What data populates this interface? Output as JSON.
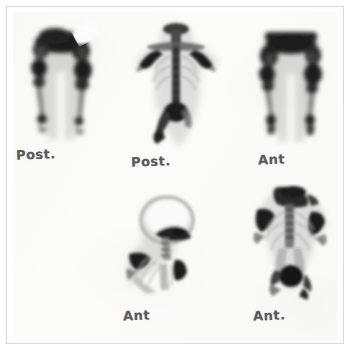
{
  "film": {
    "media_type": "nuclear-medicine-bone-scintigraphy-film",
    "background_color": "#fbfbfa",
    "border_color": "#d9d9d9",
    "uptake_color": "#1d1d1d",
    "soft_tissue_color": "#9a9a9a"
  },
  "panels": [
    {
      "id": "panel-top-left",
      "label": "Post.",
      "view": "posterior",
      "region": "lower-extremities",
      "description": "Posterior view of pelvis, femurs, knees, tibias and ankles with intense uptake at pelvis, knees and ankles"
    },
    {
      "id": "panel-top-center",
      "label": "Post.",
      "view": "posterior",
      "region": "torso-spine",
      "description": "Posterior whole-body torso showing skull base, shoulders, humeri, vertebral column, ribs and pelvis with bladder activity"
    },
    {
      "id": "panel-top-right",
      "label": "Ant",
      "view": "anterior",
      "region": "lower-extremities",
      "description": "Anterior view of pelvis, femurs, knees, tibias and ankles with intense uptake at pelvis, knees and ankles"
    },
    {
      "id": "panel-bottom-center",
      "label": "Ant",
      "view": "anterior",
      "region": "head-and-upper-chest",
      "description": "Anterior view of skull, mandible, cervical spine, shoulder and upper ribs with focal shoulder uptake"
    },
    {
      "id": "panel-bottom-right",
      "label": "Ant.",
      "view": "anterior",
      "region": "torso",
      "description": "Anterior torso showing shoulders, humeri, ribs, spine and pelvis with dense bladder activity"
    }
  ]
}
